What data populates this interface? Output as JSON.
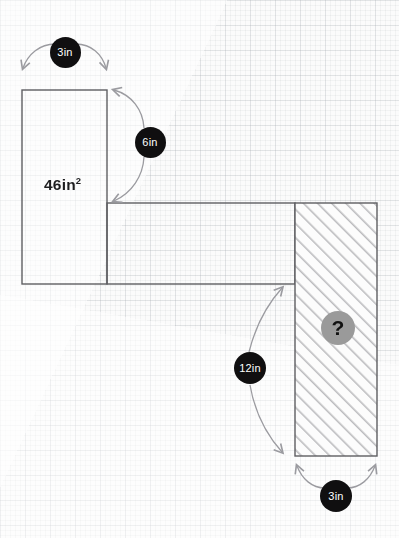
{
  "figure": {
    "background": "#fbfbfb",
    "grid_color": "#aab0b8",
    "outline_color": "#5e5e62",
    "hatch_color": "#b9b9bc",
    "badge_dark_color": "#100f10",
    "badge_gray_color": "#9a9a9a",
    "arrow_color": "#9b9ba0"
  },
  "labels": {
    "area": "46in",
    "area_exponent": "2",
    "top_width": "3in",
    "left_height": "6in",
    "right_height": "12in",
    "bottom_width": "3in",
    "unknown": "?"
  },
  "shapes": {
    "left_rect": {
      "x": 22,
      "y": 90,
      "w": 85,
      "h": 194,
      "fill": "none"
    },
    "horizontal_bar": {
      "x": 107,
      "y": 203,
      "w": 188,
      "h": 81,
      "fill": "none"
    },
    "hatched_rect": {
      "x": 295,
      "y": 203,
      "w": 82,
      "h": 253,
      "fill": "hatch-45"
    }
  },
  "dimensions": [
    {
      "name": "top-width",
      "value": "3in",
      "cx": 65,
      "cy": 52,
      "r": 15.5
    },
    {
      "name": "left-height",
      "value": "6in",
      "cx": 150,
      "cy": 142,
      "r": 15.5
    },
    {
      "name": "right-height",
      "value": "12in",
      "cx": 250,
      "cy": 368,
      "r": 16
    },
    {
      "name": "bottom-width",
      "value": "3in",
      "cx": 336,
      "cy": 496,
      "r": 16
    }
  ],
  "unknown_marker": {
    "name": "unknown-area",
    "cx": 338,
    "cy": 328,
    "r": 17
  }
}
